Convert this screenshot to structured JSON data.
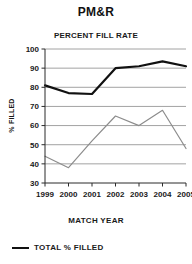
{
  "chart_data": {
    "type": "line",
    "title": "PM&R",
    "subtitle": "PERCENT FILL RATE",
    "xlabel": "MATCH YEAR",
    "ylabel": "% FILLED",
    "categories": [
      "1999",
      "2000",
      "2001",
      "2002",
      "2003",
      "2004",
      "2005"
    ],
    "x": [
      1999,
      2000,
      2001,
      2002,
      2003,
      2004,
      2005
    ],
    "ylim": [
      30,
      100
    ],
    "yticks": [
      30,
      40,
      50,
      60,
      70,
      80,
      90,
      100
    ],
    "ytick_labels": [
      "30",
      "40",
      "50",
      "60",
      "70",
      "80",
      "90",
      "100"
    ],
    "grid": "horizontal",
    "legend_position": "bottom-left",
    "series": [
      {
        "name": "TOTAL % FILLED",
        "color": "#111111",
        "style": "thick-dark",
        "values": [
          81,
          77,
          76.5,
          90,
          91,
          93.5,
          91
        ]
      },
      {
        "name": "",
        "color": "#8c8c8c",
        "style": "thin-gray",
        "values": [
          44,
          38,
          52,
          65,
          60,
          68,
          48
        ]
      }
    ]
  },
  "legend": {
    "entries": [
      {
        "label": "TOTAL % FILLED",
        "color": "#111111"
      }
    ]
  }
}
